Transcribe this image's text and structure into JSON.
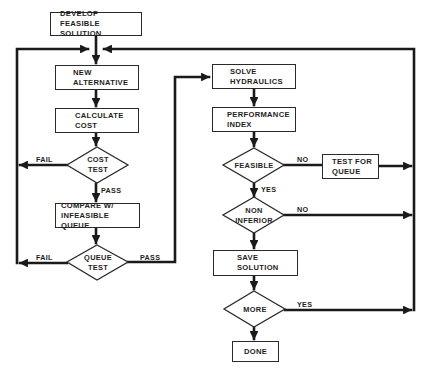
{
  "diagram": {
    "type": "flowchart",
    "colors": {
      "stroke": "#1a1a1a",
      "text": "#1e1e1e",
      "background": "#ffffff"
    },
    "nodes": {
      "develop": {
        "shape": "box",
        "line1": "DEVELOP",
        "line2": "FEASIBLE SOLUTION"
      },
      "new_alt": {
        "shape": "box",
        "line1": "NEW",
        "line2": "ALTERNATIVE"
      },
      "calc_cost": {
        "shape": "box",
        "line1": "CALCULATE",
        "line2": "COST"
      },
      "cost_test": {
        "shape": "diamond",
        "line1": "COST",
        "line2": "TEST"
      },
      "compare": {
        "shape": "box",
        "line1": "COMPARE W/",
        "line2": "INFEASIBLE QUEUE"
      },
      "queue_test": {
        "shape": "diamond",
        "line1": "QUEUE",
        "line2": "TEST"
      },
      "solve": {
        "shape": "box",
        "line1": "SOLVE",
        "line2": "HYDRAULICS"
      },
      "perf": {
        "shape": "box",
        "line1": "PERFORMANCE",
        "line2": "INDEX"
      },
      "feasible": {
        "shape": "diamond",
        "line1": "FEASIBLE"
      },
      "test_queue": {
        "shape": "box",
        "line1": "TEST FOR",
        "line2": "QUEUE"
      },
      "non_inferior": {
        "shape": "diamond",
        "line1": "NON",
        "line2": "INFERIOR"
      },
      "save": {
        "shape": "box",
        "line1": "SAVE",
        "line2": "SOLUTION"
      },
      "more": {
        "shape": "diamond",
        "line1": "MORE"
      },
      "done": {
        "shape": "box",
        "line1": "DONE"
      }
    },
    "edge_labels": {
      "cost_fail": "FAIL",
      "cost_pass": "PASS",
      "queue_fail": "FAIL",
      "queue_pass": "PASS",
      "feasible_no": "NO",
      "feasible_yes": "YES",
      "noninf_no": "NO",
      "more_yes": "YES"
    },
    "edges": [
      {
        "from": "develop",
        "to": "new_alt"
      },
      {
        "from": "new_alt",
        "to": "calc_cost"
      },
      {
        "from": "calc_cost",
        "to": "cost_test"
      },
      {
        "from": "cost_test",
        "to": "new_alt",
        "label": "FAIL"
      },
      {
        "from": "cost_test",
        "to": "compare",
        "label": "PASS"
      },
      {
        "from": "compare",
        "to": "queue_test"
      },
      {
        "from": "queue_test",
        "to": "new_alt",
        "label": "FAIL"
      },
      {
        "from": "queue_test",
        "to": "solve",
        "label": "PASS"
      },
      {
        "from": "solve",
        "to": "perf"
      },
      {
        "from": "perf",
        "to": "feasible"
      },
      {
        "from": "feasible",
        "to": "test_queue",
        "label": "NO"
      },
      {
        "from": "test_queue",
        "to": "new_alt"
      },
      {
        "from": "feasible",
        "to": "non_inferior",
        "label": "YES"
      },
      {
        "from": "non_inferior",
        "to": "new_alt",
        "label": "NO"
      },
      {
        "from": "non_inferior",
        "to": "save"
      },
      {
        "from": "save",
        "to": "more"
      },
      {
        "from": "more",
        "to": "new_alt",
        "label": "YES"
      },
      {
        "from": "more",
        "to": "done"
      }
    ]
  }
}
